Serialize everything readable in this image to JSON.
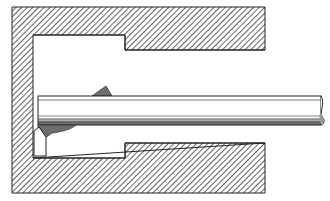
{
  "figure": {
    "title": "",
    "colors": {
      "background": "#ffffff",
      "outline": "#222222",
      "hatch": "#3a3a3a",
      "chip": "#6e6e6e",
      "bar_fill": "#ffffff",
      "bar_shade": "#9a9a9a"
    },
    "parts": [
      {
        "id": "workpiece",
        "label": ""
      },
      {
        "id": "bore-cavity",
        "label": ""
      },
      {
        "id": "boring-bar",
        "label": ""
      },
      {
        "id": "cutting-insert",
        "label": ""
      },
      {
        "id": "chip-top",
        "label": ""
      },
      {
        "id": "chip-bottom",
        "label": ""
      }
    ]
  }
}
